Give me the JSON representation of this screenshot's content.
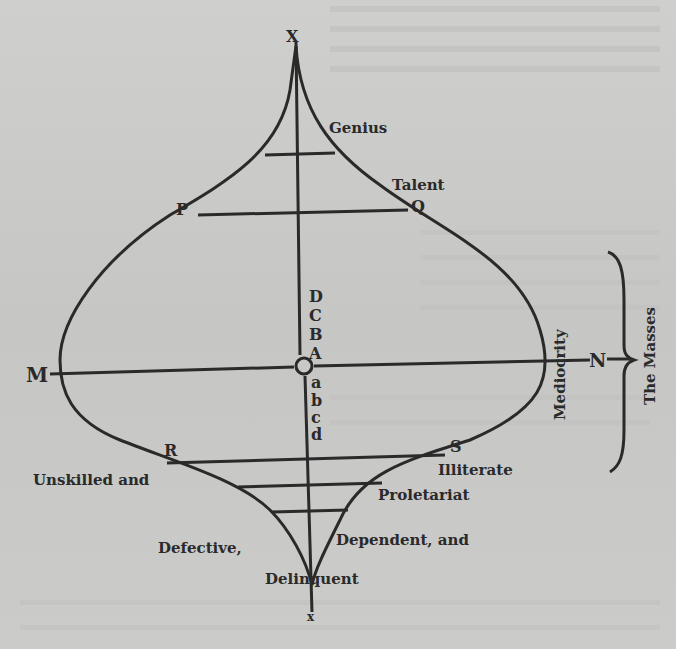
{
  "diagram": {
    "axis_top_label": "X",
    "axis_bottom_label": "x",
    "axis_left_label": "M",
    "axis_right_label": "N",
    "upper_points": [
      "D",
      "C",
      "B",
      "A"
    ],
    "lower_points": [
      "a",
      "b",
      "c",
      "d"
    ],
    "chord_upper_left": "P",
    "chord_upper_right": "Q",
    "chord_lower_left": "R",
    "chord_lower_right": "S",
    "labels": {
      "genius": "Genius",
      "talent": "Talent",
      "mediocrity": "Mediocrity",
      "the_masses": "The Masses",
      "unskilled": "Unskilled and",
      "illiterate": "Illiterate",
      "proletariat": "Proletariat",
      "defective": "Defective,",
      "dependent": "Dependent, and",
      "delinquent": "Delinquent"
    },
    "colors": {
      "ink": "#2a2a2a",
      "paper": "#c9c9c7"
    }
  }
}
